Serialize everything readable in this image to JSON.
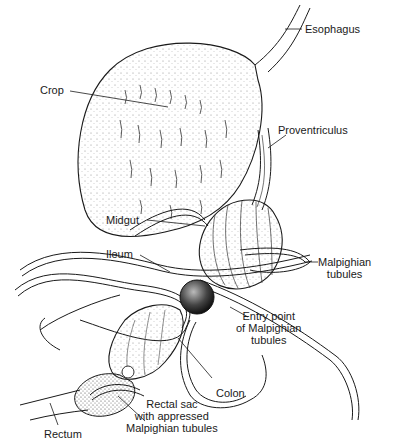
{
  "diagram": {
    "labels": {
      "esophagus": "Esophagus",
      "crop": "Crop",
      "proventriculus": "Proventriculus",
      "midgut": "Midgut",
      "ileum": "Ileum",
      "malpighian_tubules": "Malpighian\ntubules",
      "entry_point": "Entry point\nof Malpighian\ntubules",
      "colon": "Colon",
      "rectal_sac": "Rectal sac\nwith appressed\nMalpighian tubules",
      "rectum": "Rectum"
    },
    "colors": {
      "ink": "#1a1a1a",
      "background": "#ffffff",
      "stipple": "#555555"
    }
  }
}
